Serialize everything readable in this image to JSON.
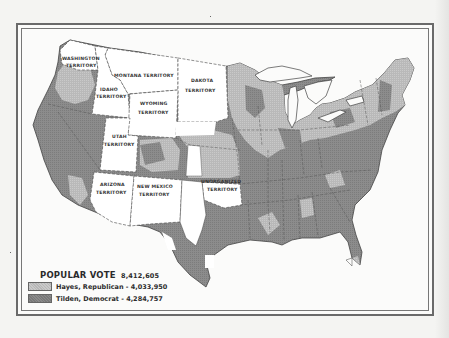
{
  "map": {
    "subject": "1876 U.S. presidential election popular vote by county",
    "colors": {
      "hayes": "#b7b7b7",
      "tilden": "#8a8a8a",
      "territory": "#ffffff",
      "border": "#444444",
      "water": "#fbfbfa"
    },
    "territories": [
      {
        "name": "WASHINGTON",
        "suffix": "TERRITORY"
      },
      {
        "name": "MONTANA TERRITORY",
        "suffix": ""
      },
      {
        "name": "DAKOTA",
        "suffix": "TERRITORY"
      },
      {
        "name": "IDAHO",
        "suffix": "TERRITORY"
      },
      {
        "name": "WYOMING",
        "suffix": "TERRITORY"
      },
      {
        "name": "UTAH",
        "suffix": "TERRITORY"
      },
      {
        "name": "ARIZONA",
        "suffix": "TERRITORY"
      },
      {
        "name": "NEW MEXICO",
        "suffix": "TERRITORY"
      },
      {
        "name": "UNORGANIZED",
        "suffix": "TERRITORY"
      }
    ]
  },
  "legend": {
    "title": "POPULAR VOTE",
    "total": "8,412,605",
    "items": [
      {
        "label": "Hayes, Republican - 4,033,950",
        "key": "hayes"
      },
      {
        "label": "Tilden, Democrat - 4,284,757",
        "key": "tilden"
      }
    ]
  }
}
